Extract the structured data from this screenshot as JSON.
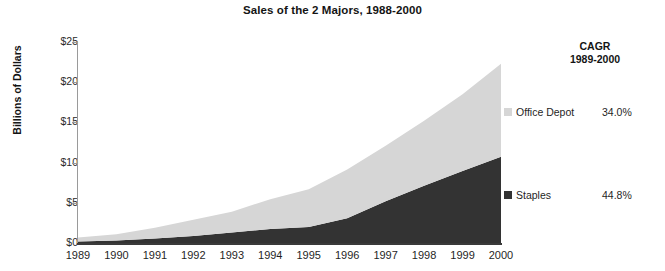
{
  "chart_data": {
    "type": "area",
    "title": "Sales of the 2 Majors, 1988-2000",
    "xlabel": "",
    "ylabel": "Billions of Dollars",
    "stacked": true,
    "grid": false,
    "ylim": [
      0,
      25
    ],
    "ytick_values": [
      0,
      5,
      10,
      15,
      20,
      25
    ],
    "ytick_labels": [
      "$0",
      "$5",
      "$10",
      "$15",
      "$20",
      "$25"
    ],
    "categories": [
      "1989",
      "1990",
      "1991",
      "1992",
      "1993",
      "1994",
      "1995",
      "1996",
      "1997",
      "1998",
      "1999",
      "2000"
    ],
    "series": [
      {
        "name": "Staples",
        "color": "#333333",
        "cagr_label": "44.8%",
        "values": [
          0.18,
          0.3,
          0.55,
          0.88,
          1.3,
          1.75,
          2.0,
          3.07,
          5.18,
          7.12,
          8.94,
          10.74
        ]
      },
      {
        "name": "Office Depot",
        "color": "#d6d6d6",
        "cagr_label": "34.0%",
        "values": [
          0.5,
          0.8,
          1.35,
          2.0,
          2.58,
          3.7,
          4.7,
          6.07,
          6.92,
          8.08,
          9.56,
          11.57
        ]
      }
    ],
    "legend": {
      "position": "right",
      "header_line1": "CAGR",
      "header_line2": "1989-2000",
      "entries": [
        {
          "label": "Office Depot",
          "value": "34.0%",
          "color": "#d6d6d6"
        },
        {
          "label": "Staples",
          "value": "44.8%",
          "color": "#333333"
        }
      ]
    }
  }
}
